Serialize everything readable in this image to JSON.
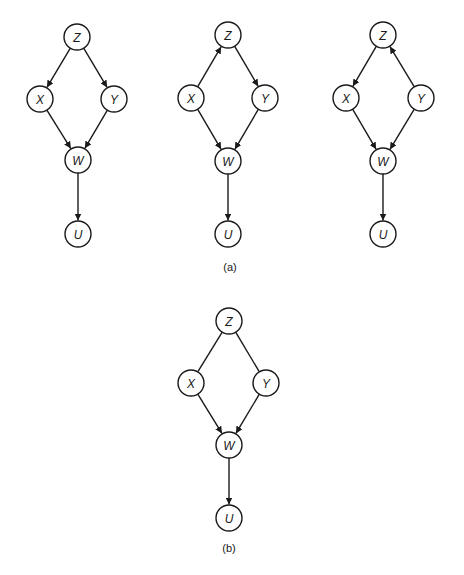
{
  "colors": {
    "stroke": "#1a1a1a",
    "node_fill": "#ffffff",
    "background": "#ffffff"
  },
  "node_radius": 13,
  "graphs": [
    {
      "id": "a1",
      "nodes": [
        {
          "id": "Z",
          "label": "Z",
          "x": 77,
          "y": 37
        },
        {
          "id": "X",
          "label": "X",
          "x": 40,
          "y": 99
        },
        {
          "id": "Y",
          "label": "Y",
          "x": 114,
          "y": 99
        },
        {
          "id": "W",
          "label": "W",
          "x": 78,
          "y": 160
        },
        {
          "id": "U",
          "label": "U",
          "x": 78,
          "y": 234
        }
      ],
      "edges": [
        {
          "from": "Z",
          "to": "X",
          "directed": true
        },
        {
          "from": "Z",
          "to": "Y",
          "directed": true
        },
        {
          "from": "X",
          "to": "W",
          "directed": true
        },
        {
          "from": "Y",
          "to": "W",
          "directed": true
        },
        {
          "from": "W",
          "to": "U",
          "directed": true
        }
      ]
    },
    {
      "id": "a2",
      "nodes": [
        {
          "id": "Z",
          "label": "Z",
          "x": 228,
          "y": 35
        },
        {
          "id": "X",
          "label": "X",
          "x": 191,
          "y": 98
        },
        {
          "id": "Y",
          "label": "Y",
          "x": 265,
          "y": 98
        },
        {
          "id": "W",
          "label": "W",
          "x": 228,
          "y": 161
        },
        {
          "id": "U",
          "label": "U",
          "x": 228,
          "y": 234
        }
      ],
      "edges": [
        {
          "from": "X",
          "to": "Z",
          "directed": true
        },
        {
          "from": "Z",
          "to": "Y",
          "directed": true
        },
        {
          "from": "X",
          "to": "W",
          "directed": true
        },
        {
          "from": "Y",
          "to": "W",
          "directed": true
        },
        {
          "from": "W",
          "to": "U",
          "directed": true
        }
      ]
    },
    {
      "id": "a3",
      "nodes": [
        {
          "id": "Z",
          "label": "Z",
          "x": 383,
          "y": 35
        },
        {
          "id": "X",
          "label": "X",
          "x": 346,
          "y": 98
        },
        {
          "id": "Y",
          "label": "Y",
          "x": 421,
          "y": 98
        },
        {
          "id": "W",
          "label": "W",
          "x": 383,
          "y": 161
        },
        {
          "id": "U",
          "label": "U",
          "x": 383,
          "y": 234
        }
      ],
      "edges": [
        {
          "from": "Z",
          "to": "X",
          "directed": true
        },
        {
          "from": "Y",
          "to": "Z",
          "directed": true
        },
        {
          "from": "X",
          "to": "W",
          "directed": true
        },
        {
          "from": "Y",
          "to": "W",
          "directed": true
        },
        {
          "from": "W",
          "to": "U",
          "directed": true
        }
      ]
    },
    {
      "id": "b",
      "nodes": [
        {
          "id": "Z",
          "label": "Z",
          "x": 229,
          "y": 321
        },
        {
          "id": "X",
          "label": "X",
          "x": 191,
          "y": 383
        },
        {
          "id": "Y",
          "label": "Y",
          "x": 266,
          "y": 383
        },
        {
          "id": "W",
          "label": "W",
          "x": 229,
          "y": 445
        },
        {
          "id": "U",
          "label": "U",
          "x": 229,
          "y": 518
        }
      ],
      "edges": [
        {
          "from": "Z",
          "to": "X",
          "directed": false
        },
        {
          "from": "Z",
          "to": "Y",
          "directed": false
        },
        {
          "from": "X",
          "to": "W",
          "directed": true
        },
        {
          "from": "Y",
          "to": "W",
          "directed": true
        },
        {
          "from": "W",
          "to": "U",
          "directed": true
        }
      ]
    }
  ],
  "captions": [
    {
      "id": "a",
      "text": "(a)",
      "x": 230,
      "y": 267
    },
    {
      "id": "b",
      "text": "(b)",
      "x": 229,
      "y": 548
    }
  ]
}
